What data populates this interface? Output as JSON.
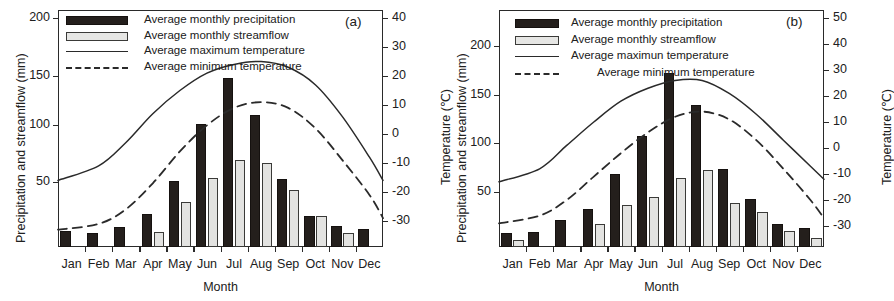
{
  "figure": {
    "panels": [
      {
        "id": "a",
        "label": "(a)",
        "y_left_title": "Precipitation and streamflow (mm)",
        "y_right_title": "Temperature (℃)",
        "x_title": "Month",
        "legend": [
          {
            "key": "bar-precip",
            "label": "Average monthly precipitation"
          },
          {
            "key": "bar-flow",
            "label": "Average monthly streamflow"
          },
          {
            "key": "line-solid",
            "label": "Average maximum temperature"
          },
          {
            "key": "line-dashed",
            "label": "Average minimum temperature"
          }
        ],
        "chart_data": {
          "type": "bar",
          "title": "(a)",
          "xlabel": "Month",
          "ylabel": "Precipitation and streamflow (mm)",
          "y2label": "Temperature (℃)",
          "ylim": [
            0,
            230
          ],
          "y2lim": [
            -35,
            45
          ],
          "yticks": [
            50,
            100,
            150,
            200
          ],
          "y2ticks": [
            -30,
            -20,
            -10,
            0,
            10,
            20,
            30,
            40
          ],
          "grid": false,
          "legend_position": "top-left",
          "categories": [
            "Jan",
            "Feb",
            "Mar",
            "Apr",
            "May",
            "Jun",
            "Jul",
            "Aug",
            "Sep",
            "Oct",
            "Nov",
            "Dec"
          ],
          "series": [
            {
              "name": "Average monthly precipitation",
              "kind": "bar",
              "axis": "left",
              "unit": "mm",
              "values": [
                5,
                3,
                9,
                21,
                51,
                103,
                145,
                111,
                53,
                19,
                10,
                7
              ]
            },
            {
              "name": "Average monthly streamflow",
              "kind": "bar",
              "axis": "left",
              "unit": "mm",
              "values": [
                0,
                0,
                0,
                4,
                32,
                54,
                70,
                67,
                43,
                19,
                3,
                0
              ]
            },
            {
              "name": "Average maximum temperature",
              "kind": "line",
              "style": "solid",
              "axis": "right",
              "unit": "℃",
              "values": [
                -16,
                -11,
                -3,
                7,
                15,
                21,
                24,
                25,
                23,
                17,
                6,
                -8,
                -16
              ]
            },
            {
              "name": "Average minimum temperature",
              "kind": "line",
              "style": "dashed",
              "axis": "right",
              "unit": "℃",
              "values": [
                -33,
                -31,
                -26,
                -17,
                -6,
                3,
                9,
                11,
                9,
                2,
                -9,
                -21,
                -29
              ]
            }
          ]
        }
      },
      {
        "id": "b",
        "label": "(b)",
        "y_left_title": "Precipitation and streamflow (mm)",
        "y_right_title": "Temperature (℃)",
        "x_title": "Month",
        "legend": [
          {
            "key": "bar-precip",
            "label": "Average monthly precipitation"
          },
          {
            "key": "bar-flow",
            "label": "Average monthly streamflow"
          },
          {
            "key": "line-solid",
            "label": "Average maximun temperature"
          },
          {
            "key": "line-dashed",
            "label": "Average minimum temperature"
          }
        ],
        "chart_data": {
          "type": "bar",
          "title": "(b)",
          "xlabel": "Month",
          "ylabel": "Precipitation and streamflow (mm)",
          "y2label": "Temperature (℃)",
          "ylim": [
            0,
            230
          ],
          "y2lim": [
            -35,
            55
          ],
          "yticks": [
            50,
            100,
            150,
            200
          ],
          "y2ticks": [
            -30,
            -20,
            -10,
            0,
            10,
            20,
            30,
            40,
            50
          ],
          "grid": false,
          "legend_position": "top-left",
          "categories": [
            "Jan",
            "Feb",
            "Mar",
            "Apr",
            "May",
            "Jun",
            "Jul",
            "Aug",
            "Sep",
            "Oct",
            "Nov",
            "Dec"
          ],
          "series": [
            {
              "name": "Average monthly precipitation",
              "kind": "bar",
              "axis": "left",
              "unit": "mm",
              "values": [
                8,
                9,
                21,
                33,
                68,
                108,
                172,
                139,
                74,
                43,
                17,
                13
              ]
            },
            {
              "name": "Average monthly streamflow",
              "kind": "bar",
              "axis": "left",
              "unit": "mm",
              "values": [
                1,
                0,
                0,
                17,
                37,
                45,
                64,
                73,
                39,
                29,
                10,
                3
              ]
            },
            {
              "name": "Average maximun temperature",
              "kind": "line",
              "style": "solid",
              "axis": "right",
              "unit": "℃",
              "values": [
                -13,
                -8,
                1,
                10,
                18,
                23,
                26,
                26,
                21,
                13,
                3,
                -7,
                -12
              ]
            },
            {
              "name": "Average minimum temperature",
              "kind": "line",
              "style": "dashed",
              "axis": "right",
              "unit": "℃",
              "values": [
                -29,
                -26,
                -20,
                -11,
                -2,
                6,
                12,
                14,
                11,
                3,
                -8,
                -20,
                -27
              ]
            }
          ]
        }
      }
    ]
  }
}
